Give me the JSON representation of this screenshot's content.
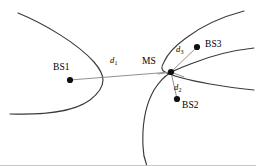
{
  "figure": {
    "type": "hyperbolic-positioning-diagram",
    "background_color": "#ffffff",
    "curve_color": "#3a3a3a",
    "measurement_line_color": "#8a8a8a",
    "marker_color": "#111111",
    "width": 256,
    "height": 166
  },
  "stations": {
    "bs1": {
      "label": "BS1",
      "dot_x": 70,
      "dot_y": 80
    },
    "bs2": {
      "label": "BS2",
      "dot_x": 177,
      "dot_y": 99
    },
    "bs3": {
      "label": "BS3",
      "dot_x": 197,
      "dot_y": 47
    }
  },
  "mobile_station": {
    "label": "MS",
    "node_x": 171,
    "node_y": 72
  },
  "distances": {
    "d1": {
      "symbol": "d",
      "subscript": "1",
      "from": "BS1",
      "to": "MS"
    },
    "d2": {
      "symbol": "d",
      "subscript": "2",
      "from": "MS",
      "to": "BS2"
    },
    "d3": {
      "symbol": "d",
      "subscript": "3",
      "from": "MS",
      "to": "BS3"
    }
  },
  "curves": [
    {
      "name": "left-hyperbola-branch",
      "opens": "left",
      "vertex_x": 103,
      "vertex_y": 80
    },
    {
      "name": "upper-right-hyperbola-branch",
      "opens": "right",
      "vertex_x": 160,
      "vertex_y": 62
    },
    {
      "name": "lower-right-hyperbola-branch",
      "opens": "right",
      "vertex_x": 152,
      "vertex_y": 90
    }
  ]
}
